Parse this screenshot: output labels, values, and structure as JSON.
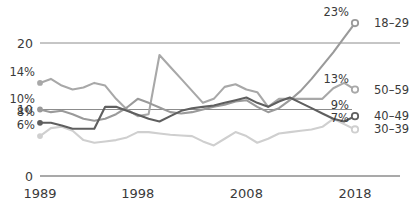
{
  "chart_data": {
    "type": "line",
    "title": "",
    "subtitle": "",
    "xlabel": "",
    "ylabel": "",
    "xlim": [
      1989,
      2018
    ],
    "ylim": [
      0,
      23
    ],
    "grid": true,
    "legend_position": "right-inline",
    "x_ticks": [
      "1989",
      "1998",
      "2008",
      "2018"
    ],
    "x_tick_values": [
      1989,
      1998,
      2008,
      2018
    ],
    "y_ticks": [
      "0",
      "10",
      "20"
    ],
    "y_tick_values": [
      0,
      10,
      20
    ],
    "series": [
      {
        "name": "18–29",
        "color": "#9a9a9a",
        "start_label": "10%",
        "end_label": "23%",
        "x": [
          1989,
          1990,
          1991,
          1992,
          1993,
          1994,
          1995,
          1996,
          1997,
          1998,
          1999,
          2000,
          2001,
          2002,
          2003,
          2004,
          2005,
          2006,
          2007,
          2008,
          2009,
          2010,
          2011,
          2012,
          2013,
          2014,
          2015,
          2016,
          2017,
          2018
        ],
        "values": [
          10,
          9.6,
          9.8,
          9.3,
          8.6,
          8.3,
          8.6,
          9.3,
          10.3,
          11.6,
          11.0,
          10.3,
          9.6,
          9.4,
          9.6,
          10.0,
          10.4,
          10.7,
          11.2,
          11.4,
          10.4,
          9.6,
          10.2,
          11.4,
          12.8,
          14.6,
          16.6,
          18.6,
          20.8,
          23
        ]
      },
      {
        "name": "50–59",
        "color": "#a8a8a8",
        "start_label": "14%",
        "end_label": "13%",
        "x": [
          1989,
          1990,
          1991,
          1992,
          1993,
          1994,
          1995,
          1996,
          1997,
          1998,
          1999,
          2000,
          2001,
          2002,
          2003,
          2004,
          2005,
          2006,
          2007,
          2008,
          2009,
          2010,
          2011,
          2012,
          2013,
          2014,
          2015,
          2016,
          2017,
          2018
        ],
        "values": [
          14,
          14.6,
          13.6,
          13.0,
          13.3,
          14.0,
          13.6,
          11.6,
          10.0,
          9.0,
          9.3,
          18.2,
          16.4,
          14.6,
          12.8,
          11.0,
          11.6,
          13.4,
          13.8,
          13.0,
          12.6,
          10.4,
          11.6,
          11.6,
          11.6,
          11.6,
          11.6,
          13.2,
          14.0,
          13
        ]
      },
      {
        "name": "40–49",
        "color": "#5f5f5f",
        "start_label": "8%",
        "end_label": "9%",
        "x": [
          1989,
          1990,
          1991,
          1992,
          1993,
          1994,
          1995,
          1996,
          1997,
          1998,
          1999,
          2000,
          2001,
          2002,
          2003,
          2004,
          2005,
          2006,
          2007,
          2008,
          2009,
          2010,
          2011,
          2012,
          2013,
          2014,
          2015,
          2016,
          2017,
          2018
        ],
        "values": [
          8,
          8.0,
          7.6,
          7.1,
          7.1,
          7.1,
          10.4,
          10.4,
          9.8,
          9.2,
          8.6,
          8.2,
          9.0,
          9.8,
          10.2,
          10.4,
          10.6,
          11.0,
          11.4,
          11.8,
          11.0,
          10.4,
          11.2,
          11.8,
          11.0,
          10.2,
          9.4,
          8.6,
          8.2,
          9
        ]
      },
      {
        "name": "30–39",
        "color": "#cfcfcf",
        "start_label": "6%",
        "end_label": "7%",
        "x": [
          1989,
          1990,
          1991,
          1992,
          1993,
          1994,
          1995,
          1996,
          1997,
          1998,
          1999,
          2000,
          2001,
          2002,
          2003,
          2004,
          2005,
          2006,
          2007,
          2008,
          2009,
          2010,
          2011,
          2012,
          2013,
          2014,
          2015,
          2016,
          2017,
          2018
        ],
        "values": [
          6,
          7.2,
          7.4,
          6.8,
          5.4,
          5.0,
          5.2,
          5.4,
          5.8,
          6.6,
          6.6,
          6.4,
          6.2,
          6.1,
          6.0,
          5.2,
          4.6,
          5.6,
          6.6,
          6.0,
          5.0,
          5.6,
          6.4,
          6.6,
          6.8,
          7.0,
          7.4,
          8.6,
          7.8,
          7
        ]
      }
    ]
  },
  "axis": {
    "baseline_color": "#808080",
    "gridline_color": "#8c8c8c"
  }
}
